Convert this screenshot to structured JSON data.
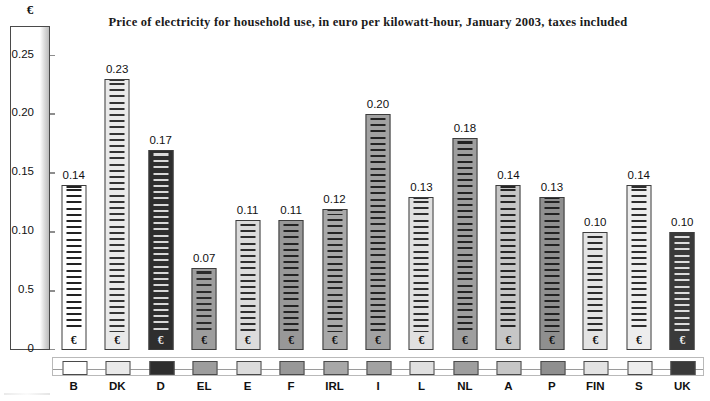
{
  "chart_data": {
    "type": "bar",
    "title": "Price of electricity for household use, in euro per kilowatt-hour, January 2003, taxes included",
    "xlabel": "",
    "ylabel": "€",
    "ylim": [
      0,
      0.27
    ],
    "grid": false,
    "legend_position": "bottom-strip",
    "categories": [
      "B",
      "DK",
      "D",
      "EL",
      "E",
      "F",
      "IRL",
      "I",
      "L",
      "NL",
      "A",
      "P",
      "FIN",
      "S",
      "UK"
    ],
    "values": [
      0.14,
      0.23,
      0.17,
      0.07,
      0.11,
      0.11,
      0.12,
      0.2,
      0.13,
      0.18,
      0.14,
      0.13,
      0.1,
      0.14,
      0.1
    ],
    "value_labels": [
      "0.14",
      "0.23",
      "0.17",
      "0.07",
      "0.11",
      "0.11",
      "0.12",
      "0.20",
      "0.13",
      "0.18",
      "0.14",
      "0.13",
      "0.10",
      "0.14",
      "0.10"
    ],
    "ytick_labels": [
      "0.25",
      "0.20",
      "0.15",
      "0.10",
      "0.5",
      "0"
    ],
    "ytick_values": [
      0.25,
      0.2,
      0.15,
      0.1,
      0.05,
      0
    ],
    "bar_colors": [
      "#ffffff",
      "#e9e9e9",
      "#2e2e2e",
      "#9d9d9d",
      "#dcdcdc",
      "#989898",
      "#a8a8a8",
      "#a2a2a2",
      "#e0e0e0",
      "#9e9e9e",
      "#c6c6c6",
      "#8f8f8f",
      "#e3e3e3",
      "#ededed",
      "#3a3a3a"
    ],
    "bar_dash_colors": [
      "#222222",
      "#333333",
      "#d8d8d8",
      "#2b2b2b",
      "#2e2e2e",
      "#232323",
      "#252525",
      "#242424",
      "#2d2d2d",
      "#222222",
      "#262626",
      "#222222",
      "#2c2c2c",
      "#2e2e2e",
      "#dcdcdc"
    ],
    "bar_euro_colors": [
      "#111111",
      "#111111",
      "#e8e8e8",
      "#111111",
      "#111111",
      "#111111",
      "#111111",
      "#111111",
      "#111111",
      "#111111",
      "#111111",
      "#111111",
      "#111111",
      "#111111",
      "#ececec"
    ],
    "currency_glyph": "€"
  },
  "axis": {
    "unit_symbol": "€"
  }
}
